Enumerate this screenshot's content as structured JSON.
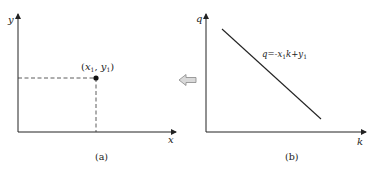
{
  "panels": [
    {
      "id": "a",
      "caption": "(a)",
      "axes": {
        "x_label": "x",
        "y_label": "y"
      },
      "point": {
        "label_open": "(",
        "label_x": "x",
        "label_x_sub": "1",
        "label_sep": ",  ",
        "label_y": "y",
        "label_y_sub": "1",
        "label_close": ")"
      }
    },
    {
      "id": "b",
      "caption": "(b)",
      "axes": {
        "x_label": "k",
        "y_label": "q"
      },
      "line": {
        "eq_prefix": "q=-x",
        "eq_sub1": "1",
        "eq_mid": "k+y",
        "eq_sub2": "1"
      }
    }
  ],
  "transform_arrow": {
    "direction": "left",
    "fill": "#d9d9d9",
    "stroke": "#888888"
  },
  "colors": {
    "ink": "#222222",
    "background": "#ffffff"
  }
}
